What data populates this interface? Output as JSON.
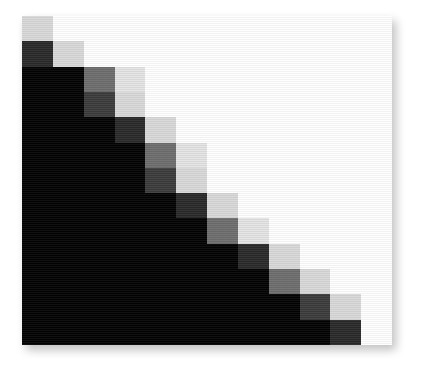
{
  "figure": {
    "name": "grayscale-matrix-heatmap",
    "background_color": "#ffffff",
    "has_drop_shadow": true,
    "shadow_color": "#8e8e8e"
  },
  "palette": {
    "black": "#030303",
    "dark_gray": "#2a2a2a",
    "mid_dark_gray": "#3c3c3c",
    "mid_gray": "#6e6e6e",
    "light_gray": "#d9d9d9",
    "pale_gray": "#e4e4e4",
    "white": "#ffffff"
  },
  "chart_data": {
    "type": "heatmap",
    "title": "",
    "xlabel": "",
    "ylabel": "",
    "rows": 12,
    "cols": 12,
    "grid": false,
    "legend": "none",
    "colormap": "grayscale",
    "value_range": [
      0,
      3
    ],
    "value_colors": {
      "0": "#ffffff",
      "1": "#d9d9d9",
      "2": "#6e6e6e",
      "3": "#030303"
    },
    "row_labels": [
      "1",
      "2",
      "3",
      "4",
      "5",
      "6",
      "7",
      "8",
      "9",
      "10",
      "11",
      "12"
    ],
    "col_labels": [
      "1",
      "2",
      "3",
      "4",
      "5",
      "6",
      "7",
      "8",
      "9",
      "10",
      "11",
      "12"
    ],
    "cells": [
      [
        "#d9d9d9",
        "#ffffff",
        "#ffffff",
        "#ffffff",
        "#ffffff",
        "#ffffff",
        "#ffffff",
        "#ffffff",
        "#ffffff",
        "#ffffff",
        "#ffffff",
        "#ffffff"
      ],
      [
        "#2a2a2a",
        "#d9d9d9",
        "#ffffff",
        "#ffffff",
        "#ffffff",
        "#ffffff",
        "#ffffff",
        "#ffffff",
        "#ffffff",
        "#ffffff",
        "#ffffff",
        "#ffffff"
      ],
      [
        "#030303",
        "#030303",
        "#6e6e6e",
        "#e4e4e4",
        "#ffffff",
        "#ffffff",
        "#ffffff",
        "#ffffff",
        "#ffffff",
        "#ffffff",
        "#ffffff",
        "#ffffff"
      ],
      [
        "#030303",
        "#030303",
        "#3c3c3c",
        "#d9d9d9",
        "#ffffff",
        "#ffffff",
        "#ffffff",
        "#ffffff",
        "#ffffff",
        "#ffffff",
        "#ffffff",
        "#ffffff"
      ],
      [
        "#030303",
        "#030303",
        "#030303",
        "#2a2a2a",
        "#d9d9d9",
        "#ffffff",
        "#ffffff",
        "#ffffff",
        "#ffffff",
        "#ffffff",
        "#ffffff",
        "#ffffff"
      ],
      [
        "#030303",
        "#030303",
        "#030303",
        "#030303",
        "#6e6e6e",
        "#e4e4e4",
        "#ffffff",
        "#ffffff",
        "#ffffff",
        "#ffffff",
        "#ffffff",
        "#ffffff"
      ],
      [
        "#030303",
        "#030303",
        "#030303",
        "#030303",
        "#3c3c3c",
        "#d9d9d9",
        "#ffffff",
        "#ffffff",
        "#ffffff",
        "#ffffff",
        "#ffffff",
        "#ffffff"
      ],
      [
        "#030303",
        "#030303",
        "#030303",
        "#030303",
        "#030303",
        "#2a2a2a",
        "#d9d9d9",
        "#ffffff",
        "#ffffff",
        "#ffffff",
        "#ffffff",
        "#ffffff"
      ],
      [
        "#030303",
        "#030303",
        "#030303",
        "#030303",
        "#030303",
        "#030303",
        "#6e6e6e",
        "#e4e4e4",
        "#ffffff",
        "#ffffff",
        "#ffffff",
        "#ffffff"
      ],
      [
        "#030303",
        "#030303",
        "#030303",
        "#030303",
        "#030303",
        "#030303",
        "#030303",
        "#2a2a2a",
        "#d9d9d9",
        "#ffffff",
        "#ffffff",
        "#ffffff"
      ],
      [
        "#030303",
        "#030303",
        "#030303",
        "#030303",
        "#030303",
        "#030303",
        "#030303",
        "#030303",
        "#6e6e6e",
        "#d9d9d9",
        "#ffffff",
        "#ffffff"
      ],
      [
        "#030303",
        "#030303",
        "#030303",
        "#030303",
        "#030303",
        "#030303",
        "#030303",
        "#030303",
        "#030303",
        "#3c3c3c",
        "#d9d9d9",
        "#ffffff"
      ],
      [
        "#030303",
        "#030303",
        "#030303",
        "#030303",
        "#030303",
        "#030303",
        "#030303",
        "#030303",
        "#030303",
        "#030303",
        "#2a2a2a",
        "#ffffff"
      ]
    ],
    "values": [
      [
        1,
        0,
        0,
        0,
        0,
        0,
        0,
        0,
        0,
        0,
        0,
        0
      ],
      [
        3,
        1,
        0,
        0,
        0,
        0,
        0,
        0,
        0,
        0,
        0,
        0
      ],
      [
        3,
        3,
        2,
        1,
        0,
        0,
        0,
        0,
        0,
        0,
        0,
        0
      ],
      [
        3,
        3,
        3,
        1,
        0,
        0,
        0,
        0,
        0,
        0,
        0,
        0
      ],
      [
        3,
        3,
        3,
        3,
        1,
        0,
        0,
        0,
        0,
        0,
        0,
        0
      ],
      [
        3,
        3,
        3,
        3,
        2,
        1,
        0,
        0,
        0,
        0,
        0,
        0
      ],
      [
        3,
        3,
        3,
        3,
        3,
        1,
        0,
        0,
        0,
        0,
        0,
        0
      ],
      [
        3,
        3,
        3,
        3,
        3,
        3,
        1,
        0,
        0,
        0,
        0,
        0
      ],
      [
        3,
        3,
        3,
        3,
        3,
        3,
        2,
        1,
        0,
        0,
        0,
        0
      ],
      [
        3,
        3,
        3,
        3,
        3,
        3,
        3,
        3,
        1,
        0,
        0,
        0
      ],
      [
        3,
        3,
        3,
        3,
        3,
        3,
        3,
        3,
        2,
        1,
        0,
        0
      ],
      [
        3,
        3,
        3,
        3,
        3,
        3,
        3,
        3,
        3,
        3,
        1,
        0
      ]
    ]
  }
}
